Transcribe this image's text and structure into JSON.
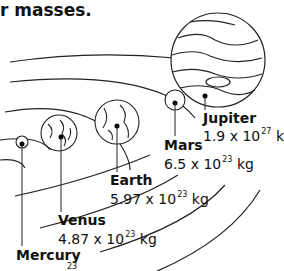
{
  "title": "r masses.",
  "planets": [
    {
      "name": "Mercury",
      "mass_base": "",
      "exp": "23",
      "unit": ""
    },
    {
      "name": "Venus",
      "mass_base": "4.87 x 10",
      "exp": "23",
      "unit": "kg"
    },
    {
      "name": "Earth",
      "mass_base": "5.97 x 10",
      "exp": "23",
      "unit": "kg"
    },
    {
      "name": "Mars",
      "mass_base": "6.5 x 10",
      "exp": "23",
      "unit": "kg"
    },
    {
      "name": "Jupiter",
      "mass_base": "1.9 x 10",
      "exp": "27",
      "unit": "kg"
    }
  ]
}
